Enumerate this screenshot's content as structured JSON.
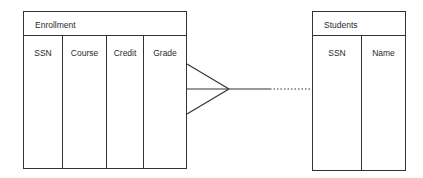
{
  "diagram": {
    "type": "entity-relationship",
    "entities": [
      {
        "name": "Enrollment",
        "attributes": [
          "SSN",
          "Course",
          "Credit",
          "Grade"
        ]
      },
      {
        "name": "Students",
        "attributes": [
          "SSN",
          "Name"
        ]
      }
    ],
    "relationship": {
      "from": "Enrollment",
      "to": "Students",
      "from_cardinality": "many (crow's foot)",
      "to_cardinality": "one",
      "line_style": "solid then dotted"
    }
  }
}
